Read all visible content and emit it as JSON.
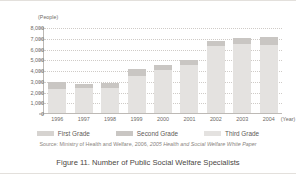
{
  "figure": {
    "caption": "Figure 11. Number of Public Social Welfare Specialists",
    "source_prefix": "Source:  Ministry of Health and Welfare, 2006,",
    "source_italic": "2005 Health and Social Welfare White Paper"
  },
  "chart_data": {
    "type": "bar",
    "stacked": true,
    "title": "Figure 11. Number of Public Social Welfare Specialists",
    "xlabel": "(Year)",
    "ylabel": "(People)",
    "unit_note": "(People)",
    "categories": [
      "1996",
      "1997",
      "1998",
      "1999",
      "2000",
      "2001",
      "2002",
      "2003",
      "2004"
    ],
    "ylim": [
      0,
      8000
    ],
    "ytick_labels": [
      "8,000",
      "7,000",
      "6,000",
      "5,000",
      "4,000",
      "3,000",
      "2,000",
      "1,000",
      "0"
    ],
    "ytick_values": [
      8000,
      7000,
      6000,
      5000,
      4000,
      3000,
      2000,
      1000,
      0
    ],
    "grid": true,
    "grid_style": "dotted-horizontal",
    "legend_position": "bottom",
    "series": [
      {
        "name": "Third Grade",
        "color": "#e4e2e0",
        "values": [
          2300,
          2400,
          2450,
          3550,
          4050,
          4600,
          6300,
          6550,
          6400
        ]
      },
      {
        "name": "Second Grade",
        "color": "#c9c6c3",
        "values": [
          700,
          400,
          450,
          650,
          500,
          450,
          500,
          500,
          800
        ]
      },
      {
        "name": "First Grade",
        "color": "#d6d3d0",
        "values": [
          0,
          0,
          0,
          0,
          0,
          0,
          0,
          0,
          0
        ]
      }
    ],
    "totals": [
      3000,
      2800,
      2900,
      4200,
      4550,
      5050,
      6800,
      7050,
      7200
    ]
  },
  "legend": {
    "items": [
      {
        "label": "First Grade",
        "color": "#d6d3d0"
      },
      {
        "label": "Second Grade",
        "color": "#c9c6c3"
      },
      {
        "label": "Third Grade",
        "color": "#e4e2e0"
      }
    ]
  }
}
